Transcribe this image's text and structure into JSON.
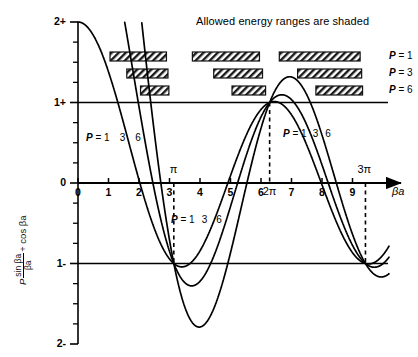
{
  "figure": {
    "title": "Allowed energy ranges are shaded",
    "y_axis_title_parts": {
      "p": "P",
      "numerator": "sin βa",
      "denominator": "βa",
      "tail": "+ cos βa"
    },
    "x_axis_label": "βa"
  },
  "chart_data": {
    "type": "line",
    "title": "Allowed energy ranges are shaded",
    "xlabel": "βa",
    "ylabel": "P sin(βa)/(βa) + cos βa",
    "xlim": [
      0,
      10
    ],
    "ylim": [
      -2,
      2
    ],
    "grid": false,
    "legend_position": "inline-curve-labels",
    "x_ticks": [
      "0",
      "1",
      "2",
      "3",
      "4",
      "5",
      "6",
      "7",
      "8",
      "9"
    ],
    "x_tick_values": [
      0,
      1,
      2,
      3,
      4,
      5,
      6,
      7,
      8,
      9
    ],
    "y_ticks": [
      "+2",
      "+1",
      "0",
      "-1",
      "-2"
    ],
    "y_tick_values": [
      2,
      1,
      0,
      -1,
      -2
    ],
    "y_minor_step": 0.25,
    "special_x_marks": [
      {
        "label": "π",
        "value": 3.14159
      },
      {
        "label": "2π",
        "value": 6.28319
      },
      {
        "label": "3π",
        "value": 9.42478
      }
    ],
    "reference_lines": [
      {
        "label": "+1",
        "y": 1
      },
      {
        "label": "-1",
        "y": -1
      }
    ],
    "dashed_verticals": [
      {
        "label": "π",
        "x": 3.14159,
        "y_from": 0,
        "y_to": -1
      },
      {
        "label": "2π",
        "x": 6.28319,
        "y_from": 1,
        "y_to": 0
      },
      {
        "label": "3π",
        "x": 9.42478,
        "y_from": 0,
        "y_to": -1
      }
    ],
    "series": [
      {
        "name": "P = 1",
        "P": 1,
        "color": "#000000",
        "formula": "P*sin(x)/x + cos(x)",
        "peak_at_2pi_plus": 1.1,
        "trough_min": -1.05
      },
      {
        "name": "P = 3",
        "P": 3,
        "color": "#000000",
        "formula": "P*sin(x)/x + cos(x)",
        "peak_at_2pi_plus": 1.22,
        "trough_min": -1.28
      },
      {
        "name": "P = 6",
        "P": 6,
        "color": "#000000",
        "formula": "P*sin(x)/x + cos(x)",
        "peak_at_2pi_plus": 1.45,
        "trough_min": -1.8
      }
    ],
    "allowed_bands": [
      {
        "P": 1,
        "label": "P = 1",
        "row": 0,
        "bands": [
          [
            1.05,
            2.9
          ],
          [
            3.75,
            5.95
          ],
          [
            6.6,
            9.25
          ]
        ]
      },
      {
        "P": 3,
        "label": "P = 3",
        "row": 1,
        "bands": [
          [
            1.6,
            2.95
          ],
          [
            4.45,
            6.05
          ],
          [
            7.2,
            9.3
          ]
        ]
      },
      {
        "P": 6,
        "label": "P = 6",
        "row": 2,
        "bands": [
          [
            2.05,
            2.98
          ],
          [
            5.05,
            6.15
          ],
          [
            7.8,
            9.33
          ]
        ]
      }
    ],
    "band_row_labels": [
      "P = 1",
      "P = 3",
      "P = 6"
    ],
    "curve_annotations": [
      {
        "text": "P = 1",
        "nums": [
          "3",
          "6"
        ],
        "x": 1.2,
        "y": 0.55,
        "name": "curve-label-left"
      },
      {
        "text": "P = 1",
        "nums": [
          "3",
          "6"
        ],
        "x": 3.6,
        "y": -0.55,
        "name": "curve-label-middle"
      },
      {
        "text": "P = 1",
        "nums": [
          "3",
          "6"
        ],
        "x": 6.6,
        "y": 0.55,
        "name": "curve-label-right"
      }
    ]
  },
  "annotations": {
    "left_label_p": "P",
    "left_label_eq": "= 1",
    "left_label_n1": "3",
    "left_label_n2": "6",
    "mid_label_p": "P",
    "mid_label_eq": "= 1",
    "mid_label_n1": "3",
    "mid_label_n2": "6",
    "right_label_p": "P",
    "right_label_eq": "= 1",
    "right_label_n1": "3",
    "right_label_n2": "6",
    "band_p1": "P",
    "band_p1_eq": "= 1",
    "band_p3": "P",
    "band_p3_eq": "= 3",
    "band_p6": "P",
    "band_p6_eq": "= 6",
    "pi_mark": "π",
    "twopi_mark": "2π",
    "threepi_mark": "3π"
  }
}
